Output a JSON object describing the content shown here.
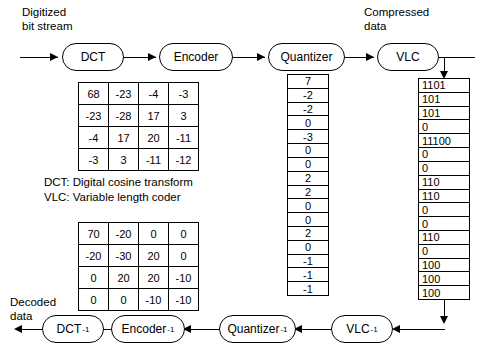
{
  "labels": {
    "input": "Digitized\nbit stream",
    "compressed": "Compressed\ndata",
    "decoded": "Decoded\ndata"
  },
  "legend": {
    "line1": "DCT: Digital cosine transform",
    "line2": "VLC: Variable length coder"
  },
  "encode_chain": [
    {
      "label": "DCT",
      "sup": ""
    },
    {
      "label": "Encoder",
      "sup": ""
    },
    {
      "label": "Quantizer",
      "sup": ""
    },
    {
      "label": "VLC",
      "sup": ""
    }
  ],
  "decode_chain": [
    {
      "label": "DCT",
      "sup": "-1"
    },
    {
      "label": "Encoder",
      "sup": "-1"
    },
    {
      "label": "Quantizer",
      "sup": "-1"
    },
    {
      "label": "VLC",
      "sup": "-1"
    }
  ],
  "dct_matrix": {
    "rows": [
      [
        "68",
        "-23",
        "-4",
        "-3"
      ],
      [
        "-23",
        "-28",
        "17",
        "3"
      ],
      [
        "-4",
        "17",
        "20",
        "-11"
      ],
      [
        "-3",
        "3",
        "-11",
        "-12"
      ]
    ]
  },
  "reconstructed_matrix": {
    "rows": [
      [
        "70",
        "-20",
        "0",
        "0"
      ],
      [
        "-20",
        "-30",
        "20",
        "0"
      ],
      [
        "0",
        "20",
        "20",
        "-10"
      ],
      [
        "0",
        "0",
        "-10",
        "-10"
      ]
    ]
  },
  "quantized_column": {
    "values": [
      "7",
      "-2",
      "-2",
      "0",
      "-3",
      "0",
      "0",
      "2",
      "2",
      "0",
      "0",
      "2",
      "0",
      "-1",
      "-1",
      "-1"
    ]
  },
  "vlc_column": {
    "values": [
      "1101",
      "101",
      "101",
      "0",
      "11100",
      "0",
      "0",
      "110",
      "110",
      "0",
      "0",
      "110",
      "0",
      "100",
      "100",
      "100"
    ]
  },
  "colors": {
    "stroke": "#000000",
    "background": "#ffffff"
  }
}
